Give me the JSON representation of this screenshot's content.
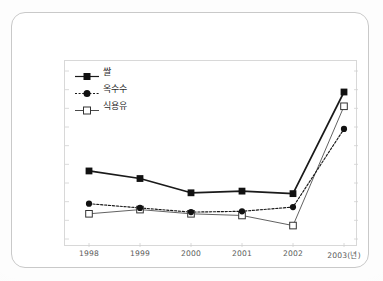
{
  "chart_data": {
    "type": "line",
    "title": "",
    "subtitle": "",
    "xlabel": "",
    "ylabel": "",
    "grid": false,
    "legend_position": "top-left",
    "axis_note": "y-axis has unlabeled tick marks only; values are relative index positions read off the plot",
    "categories": [
      "1998",
      "1999",
      "2000",
      "2001",
      "2002",
      "2003(년)"
    ],
    "x_tick_labels": [
      "1998",
      "1999",
      "2000",
      "2001",
      "2002",
      "2003(년)"
    ],
    "ylim": [
      0,
      100
    ],
    "series": [
      {
        "name": "쌀",
        "marker": "filled-square",
        "line_style": "solid",
        "color": "#1a1a1a",
        "values": [
          40.5,
          36.0,
          27.5,
          28.5,
          27.0,
          87.5
        ]
      },
      {
        "name": "옥수수",
        "marker": "filled-circle",
        "line_style": "dotted",
        "color": "#1a1a1a",
        "values": [
          21.0,
          18.5,
          16.0,
          16.5,
          19.0,
          65.5
        ]
      },
      {
        "name": "식용유",
        "marker": "hollow-square",
        "line_style": "solid-thin",
        "color": "#5a5a5a",
        "values": [
          15.0,
          17.5,
          15.0,
          14.0,
          8.0,
          79.0
        ]
      }
    ]
  },
  "legend": {
    "items": [
      {
        "label": "쌀",
        "marker": "filled-square"
      },
      {
        "label": "옥수수",
        "marker": "filled-circle"
      },
      {
        "label": "식용유",
        "marker": "hollow-square"
      }
    ]
  },
  "colors": {
    "series_dark": "#1a1a1a",
    "series_gray": "#5a5a5a",
    "frame": "#d8d8d8",
    "card_border": "#c9c9c9",
    "page_bg": "#fdfdfd",
    "tick_label": "#5a5a5a"
  }
}
